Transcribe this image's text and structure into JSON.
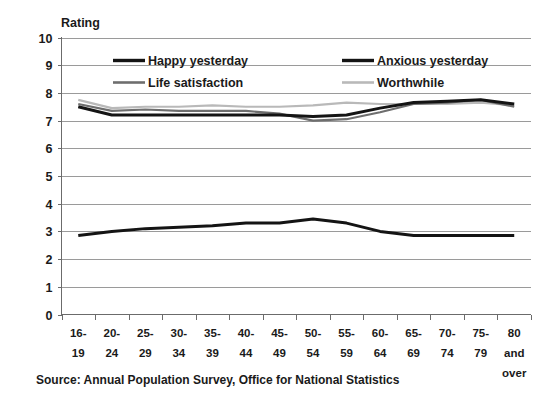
{
  "chart_data": {
    "type": "line",
    "title": "",
    "ylabel": "Rating",
    "xlabel": "",
    "ylim": [
      0,
      10
    ],
    "ytick_step": 1,
    "grid": true,
    "legend_position": "top-inside",
    "categories": [
      "16-19",
      "20-24",
      "25-29",
      "30-34",
      "35-39",
      "40-44",
      "45-49",
      "50-54",
      "55-59",
      "60-64",
      "65-69",
      "70-74",
      "75-79",
      "80 and over"
    ],
    "category_lines": [
      [
        "16-",
        "19"
      ],
      [
        "20-",
        "24"
      ],
      [
        "25-",
        "29"
      ],
      [
        "30-",
        "34"
      ],
      [
        "35-",
        "39"
      ],
      [
        "40-",
        "44"
      ],
      [
        "45-",
        "49"
      ],
      [
        "50-",
        "54"
      ],
      [
        "55-",
        "59"
      ],
      [
        "60-",
        "64"
      ],
      [
        "65-",
        "69"
      ],
      [
        "70-",
        "74"
      ],
      [
        "75-",
        "79"
      ],
      [
        "80",
        "and",
        "over"
      ]
    ],
    "series": [
      {
        "name": "Happy yesterday",
        "color": "#141414",
        "width": 3.0,
        "values": [
          7.5,
          7.2,
          7.2,
          7.2,
          7.2,
          7.2,
          7.2,
          7.15,
          7.2,
          7.45,
          7.65,
          7.7,
          7.75,
          7.6
        ]
      },
      {
        "name": "Anxious yesterday",
        "color": "#141414",
        "width": 3.0,
        "values": [
          2.85,
          3.0,
          3.1,
          3.15,
          3.2,
          3.3,
          3.3,
          3.45,
          3.3,
          3.0,
          2.85,
          2.85,
          2.85,
          2.85
        ]
      },
      {
        "name": "Life satisfaction",
        "color": "#6e6e6e",
        "width": 2.2,
        "values": [
          7.6,
          7.35,
          7.4,
          7.35,
          7.35,
          7.35,
          7.25,
          7.0,
          7.05,
          7.3,
          7.6,
          7.65,
          7.75,
          7.5
        ]
      },
      {
        "name": "Worthwhile",
        "color": "#b9b9b9",
        "width": 2.2,
        "values": [
          7.75,
          7.45,
          7.5,
          7.5,
          7.55,
          7.5,
          7.5,
          7.55,
          7.65,
          7.6,
          7.6,
          7.6,
          7.65,
          7.55
        ]
      }
    ],
    "ytick_labels": [
      "10",
      "9",
      "8",
      "7",
      "6",
      "5",
      "4",
      "3",
      "2",
      "1",
      "0"
    ],
    "source": "Source: Annual Population Survey, Office for National Statistics"
  },
  "legend": {
    "items": [
      {
        "label": "Happy yesterday",
        "swatch": "legend-swatch-happy"
      },
      {
        "label": "Anxious yesterday",
        "swatch": "legend-swatch-anxious"
      },
      {
        "label": "Life satisfaction",
        "swatch": "legend-swatch-life"
      },
      {
        "label": "Worthwhile",
        "swatch": "legend-swatch-worthwhile"
      }
    ]
  }
}
